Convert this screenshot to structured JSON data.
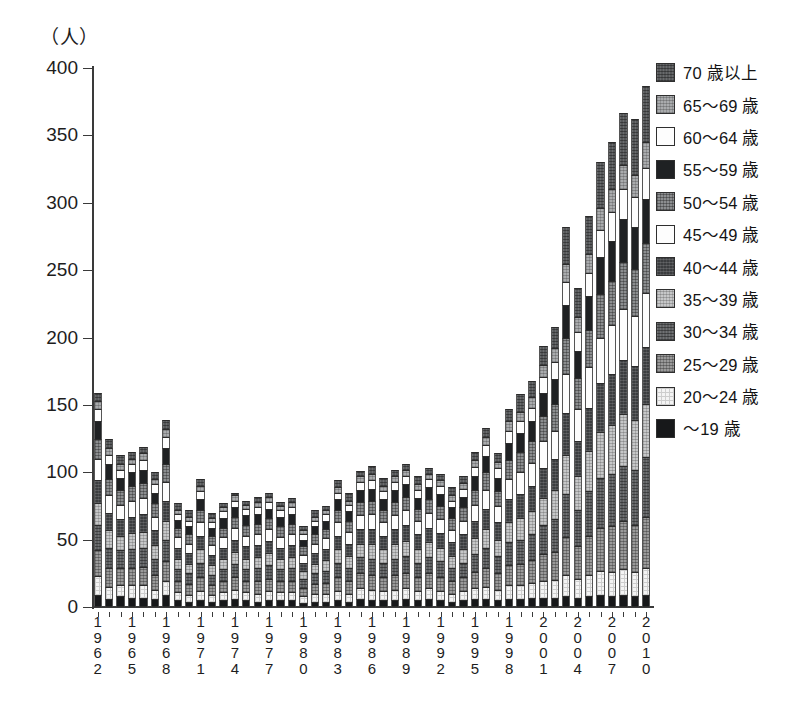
{
  "chart_data": {
    "type": "bar",
    "stacked": true,
    "title": "",
    "subtitle": "",
    "xlabel": "",
    "ylabel": "（人）",
    "unit_label": "（人）",
    "ylim": [
      0,
      400
    ],
    "yticks": [
      0,
      50,
      100,
      150,
      200,
      250,
      300,
      350,
      400
    ],
    "ytick_labels": [
      "0",
      "50",
      "100",
      "150",
      "200",
      "250",
      "300",
      "350",
      "400"
    ],
    "grid": false,
    "legend_position": "right",
    "x": [
      1962,
      1963,
      1964,
      1965,
      1966,
      1967,
      1968,
      1969,
      1970,
      1971,
      1972,
      1973,
      1974,
      1975,
      1976,
      1977,
      1978,
      1979,
      1980,
      1981,
      1982,
      1983,
      1984,
      1985,
      1986,
      1987,
      1988,
      1989,
      1990,
      1991,
      1992,
      1993,
      1994,
      1995,
      1996,
      1997,
      1998,
      1999,
      2000,
      2001,
      2002,
      2003,
      2004,
      2005,
      2006,
      2007,
      2008,
      2009,
      2010
    ],
    "xtick_labels": [
      "1962",
      "1965",
      "1968",
      "1971",
      "1974",
      "1977",
      "1980",
      "1983",
      "1986",
      "1989",
      "1992",
      "1995",
      "1998",
      "2001",
      "2004",
      "2007",
      "2010"
    ],
    "xtick_label_years": [
      1962,
      1965,
      1968,
      1971,
      1974,
      1977,
      1980,
      1983,
      1986,
      1989,
      1992,
      1995,
      1998,
      2001,
      2004,
      2007,
      2010
    ],
    "totals": [
      159,
      125,
      113,
      115,
      119,
      100,
      139,
      77,
      72,
      95,
      70,
      77,
      85,
      79,
      82,
      85,
      78,
      81,
      60,
      72,
      75,
      94,
      85,
      101,
      105,
      96,
      102,
      106,
      97,
      103,
      99,
      89,
      97,
      115,
      133,
      114,
      147,
      158,
      168,
      194,
      208,
      282,
      237,
      290,
      330,
      345,
      367,
      362,
      387
    ],
    "series": [
      {
        "name": "～19 歳",
        "key": "age_u19",
        "fill": "f-0",
        "color": "#17181a",
        "values": [
          9,
          6,
          8,
          7,
          7,
          6,
          9,
          5,
          4,
          5,
          4,
          5,
          6,
          5,
          4,
          5,
          5,
          5,
          3,
          4,
          4,
          5,
          4,
          6,
          5,
          5,
          5,
          6,
          5,
          6,
          5,
          4,
          5,
          6,
          6,
          5,
          6,
          6,
          7,
          7,
          7,
          8,
          7,
          8,
          9,
          8,
          9,
          8,
          9
        ]
      },
      {
        "name": "20～24 歳",
        "key": "age_20_24",
        "fill": "f-1",
        "color": "#f4f4f4",
        "values": [
          14,
          9,
          8,
          9,
          9,
          7,
          10,
          6,
          5,
          7,
          5,
          6,
          7,
          6,
          6,
          7,
          6,
          6,
          5,
          6,
          6,
          7,
          6,
          8,
          8,
          7,
          8,
          8,
          7,
          8,
          7,
          6,
          7,
          8,
          9,
          8,
          10,
          10,
          11,
          12,
          13,
          16,
          14,
          16,
          18,
          18,
          19,
          18,
          20
        ]
      },
      {
        "name": "25～29 歳",
        "key": "age_25_29",
        "fill": "f-2",
        "color": "#9a9a9a",
        "values": [
          19,
          14,
          13,
          13,
          14,
          11,
          15,
          8,
          8,
          10,
          7,
          8,
          9,
          8,
          9,
          9,
          8,
          8,
          6,
          7,
          8,
          10,
          9,
          11,
          11,
          10,
          11,
          11,
          10,
          11,
          10,
          9,
          10,
          12,
          14,
          12,
          15,
          16,
          17,
          20,
          21,
          28,
          24,
          29,
          32,
          34,
          36,
          35,
          38
        ]
      },
      {
        "name": "30～34 歳",
        "key": "age_30_34",
        "fill": "f-3",
        "color": "#5d5f61",
        "values": [
          19,
          15,
          13,
          14,
          14,
          12,
          16,
          9,
          8,
          11,
          8,
          9,
          10,
          9,
          10,
          10,
          9,
          10,
          7,
          8,
          9,
          11,
          10,
          12,
          12,
          11,
          12,
          13,
          11,
          12,
          12,
          10,
          11,
          13,
          15,
          13,
          17,
          18,
          19,
          22,
          24,
          32,
          27,
          33,
          37,
          39,
          41,
          41,
          44
        ]
      },
      {
        "name": "35～39 歳",
        "key": "age_35_39",
        "fill": "f-4",
        "color": "#c6c7c8",
        "values": [
          16,
          13,
          11,
          12,
          12,
          10,
          14,
          8,
          7,
          10,
          7,
          8,
          9,
          8,
          8,
          9,
          8,
          8,
          6,
          7,
          8,
          10,
          9,
          10,
          11,
          10,
          11,
          11,
          10,
          11,
          10,
          9,
          10,
          12,
          14,
          12,
          15,
          16,
          17,
          20,
          22,
          29,
          25,
          30,
          34,
          36,
          38,
          37,
          40
        ]
      },
      {
        "name": "40～44 歳",
        "key": "age_40_44",
        "fill": "f-5",
        "color": "#3b3d3f",
        "values": [
          17,
          13,
          12,
          12,
          13,
          11,
          15,
          8,
          8,
          10,
          8,
          8,
          9,
          9,
          9,
          9,
          8,
          9,
          6,
          8,
          8,
          10,
          9,
          11,
          11,
          10,
          11,
          12,
          11,
          11,
          11,
          10,
          11,
          13,
          15,
          13,
          17,
          18,
          19,
          22,
          23,
          31,
          26,
          32,
          36,
          38,
          40,
          40,
          42
        ]
      },
      {
        "name": "45～49 歳",
        "key": "age_45_49",
        "fill": "f-6",
        "color": "#fdfdfd",
        "values": [
          16,
          13,
          11,
          12,
          12,
          10,
          14,
          8,
          7,
          10,
          7,
          8,
          9,
          8,
          8,
          9,
          8,
          8,
          6,
          7,
          8,
          10,
          9,
          10,
          11,
          10,
          10,
          11,
          10,
          11,
          10,
          9,
          10,
          12,
          14,
          12,
          15,
          16,
          17,
          20,
          21,
          29,
          24,
          30,
          34,
          36,
          38,
          37,
          40
        ]
      },
      {
        "name": "50～54 歳",
        "key": "age_50_54",
        "fill": "f-7",
        "color": "#8c8e90",
        "values": [
          15,
          12,
          11,
          11,
          11,
          10,
          13,
          7,
          7,
          9,
          7,
          7,
          8,
          8,
          8,
          8,
          8,
          8,
          6,
          7,
          7,
          9,
          8,
          10,
          10,
          9,
          10,
          10,
          9,
          10,
          10,
          9,
          10,
          11,
          13,
          11,
          14,
          15,
          16,
          19,
          20,
          27,
          23,
          28,
          32,
          33,
          35,
          35,
          37
        ]
      },
      {
        "name": "55～59 歳",
        "key": "age_55_59",
        "fill": "f-8",
        "color": "#1f2123",
        "values": [
          13,
          11,
          9,
          10,
          10,
          8,
          12,
          6,
          6,
          8,
          6,
          7,
          7,
          7,
          7,
          7,
          7,
          7,
          5,
          6,
          6,
          8,
          7,
          9,
          9,
          8,
          9,
          9,
          8,
          9,
          9,
          8,
          8,
          10,
          12,
          10,
          13,
          14,
          15,
          17,
          18,
          24,
          20,
          25,
          28,
          30,
          32,
          31,
          33
        ]
      },
      {
        "name": "60～64 歳",
        "key": "age_60_64",
        "fill": "f-9",
        "color": "#fdfdfd",
        "values": [
          9,
          7,
          6,
          6,
          7,
          6,
          8,
          4,
          4,
          6,
          4,
          5,
          5,
          5,
          5,
          5,
          5,
          5,
          4,
          4,
          5,
          5,
          5,
          6,
          6,
          6,
          6,
          6,
          6,
          6,
          6,
          5,
          6,
          7,
          8,
          7,
          9,
          9,
          10,
          12,
          13,
          17,
          14,
          17,
          20,
          21,
          22,
          22,
          23
        ]
      },
      {
        "name": "65～69 歳",
        "key": "age_65_69",
        "fill": "f-10",
        "color": "#a9abad",
        "values": [
          6,
          5,
          4,
          4,
          5,
          4,
          6,
          3,
          3,
          4,
          3,
          3,
          4,
          3,
          4,
          4,
          3,
          4,
          3,
          3,
          3,
          4,
          3,
          4,
          5,
          4,
          4,
          5,
          4,
          4,
          4,
          4,
          4,
          5,
          6,
          5,
          7,
          7,
          8,
          9,
          10,
          14,
          11,
          14,
          16,
          17,
          18,
          17,
          19
        ]
      },
      {
        "name": "70 歳以上",
        "key": "age_70_plus",
        "fill": "f-11",
        "color": "#56585a",
        "values": [
          6,
          7,
          7,
          5,
          5,
          5,
          7,
          5,
          5,
          5,
          4,
          3,
          2,
          3,
          4,
          3,
          3,
          3,
          3,
          5,
          3,
          5,
          6,
          4,
          6,
          6,
          5,
          4,
          6,
          4,
          5,
          6,
          5,
          6,
          7,
          6,
          9,
          13,
          12,
          14,
          16,
          27,
          22,
          28,
          34,
          35,
          39,
          41,
          42
        ]
      }
    ],
    "legend_entries": [
      {
        "label": "70 歳以上",
        "fill": "f-11",
        "color": "#56585a"
      },
      {
        "label": "65～69 歳",
        "fill": "f-10",
        "color": "#a9abad"
      },
      {
        "label": "60～64 歳",
        "fill": "f-9",
        "color": "#fdfdfd"
      },
      {
        "label": "55～59 歳",
        "fill": "f-8",
        "color": "#1f2123"
      },
      {
        "label": "50～54 歳",
        "fill": "f-7",
        "color": "#8c8e90"
      },
      {
        "label": "45～49 歳",
        "fill": "f-6",
        "color": "#fdfdfd"
      },
      {
        "label": "40～44 歳",
        "fill": "f-5",
        "color": "#3b3d3f"
      },
      {
        "label": "35～39 歳",
        "fill": "f-4",
        "color": "#c6c7c8"
      },
      {
        "label": "30～34 歳",
        "fill": "f-3",
        "color": "#5d5f61"
      },
      {
        "label": "25～29 歳",
        "fill": "f-2",
        "color": "#9a9a9a"
      },
      {
        "label": "20～24 歳",
        "fill": "f-1",
        "color": "#f4f4f4"
      },
      {
        "label": "～19 歳",
        "fill": "f-0",
        "color": "#17181a"
      }
    ]
  },
  "caption": ""
}
